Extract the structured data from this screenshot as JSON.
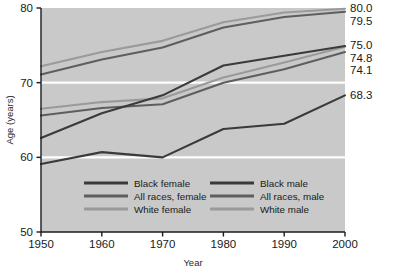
{
  "chart_data": {
    "type": "line",
    "title": "",
    "xlabel": "Year",
    "ylabel": "Age (years)",
    "x": [
      1950,
      1960,
      1970,
      1980,
      1990,
      2000
    ],
    "xtick_labels": [
      "1950",
      "1960",
      "1970",
      "1980",
      "1990",
      "2000"
    ],
    "ytick_labels": [
      "50",
      "60",
      "70",
      "80"
    ],
    "yticks": [
      50,
      60,
      70,
      80
    ],
    "xlim": [
      1950,
      2000
    ],
    "ylim": [
      50,
      80
    ],
    "grid": "horizontal white gridlines at 60 and 70",
    "legend_position": "inside bottom-center, two columns",
    "plot_background": "#c9c9c9",
    "series": [
      {
        "name": "White female",
        "color": "#9a9a9a",
        "values": [
          72.2,
          74.1,
          75.6,
          78.1,
          79.4,
          79.9
        ],
        "end_label": "80.0"
      },
      {
        "name": "All races, female",
        "color": "#5e5e5e",
        "values": [
          71.1,
          73.1,
          74.7,
          77.4,
          78.8,
          79.5
        ],
        "end_label": "79.5"
      },
      {
        "name": "White male",
        "color": "#9a9a9a",
        "values": [
          66.5,
          67.4,
          67.9,
          70.7,
          72.7,
          74.8
        ],
        "end_label": "75.0"
      },
      {
        "name": "All races, male",
        "color": "#5e5e5e",
        "values": [
          65.6,
          66.6,
          67.1,
          70.0,
          71.8,
          74.1
        ],
        "end_label": "74.8"
      },
      {
        "name": "Black female",
        "color": "#3a3a3a",
        "values": [
          62.6,
          65.9,
          68.3,
          72.3,
          73.6,
          74.9
        ],
        "end_label": "74.1"
      },
      {
        "name": "Black male",
        "color": "#3a3a3a",
        "values": [
          59.1,
          60.7,
          60.0,
          63.8,
          64.5,
          68.3
        ],
        "end_label": "68.3"
      }
    ],
    "end_labels": [
      {
        "text": "80.0",
        "value": 80.0
      },
      {
        "text": "79.5",
        "value": 79.5
      },
      {
        "text": "75.0",
        "value": 75.0
      },
      {
        "text": "74.8",
        "value": 74.8
      },
      {
        "text": "74.1",
        "value": 74.1
      },
      {
        "text": "68.3",
        "value": 68.3
      }
    ],
    "legend": [
      {
        "label": "Black female",
        "color": "#3a3a3a",
        "column": 0
      },
      {
        "label": "All races, female",
        "color": "#5e5e5e",
        "column": 0
      },
      {
        "label": "White female",
        "color": "#9a9a9a",
        "column": 0
      },
      {
        "label": "Black male",
        "color": "#3a3a3a",
        "column": 1
      },
      {
        "label": "All races, male",
        "color": "#5e5e5e",
        "column": 1
      },
      {
        "label": "White male",
        "color": "#9a9a9a",
        "column": 1
      }
    ]
  }
}
